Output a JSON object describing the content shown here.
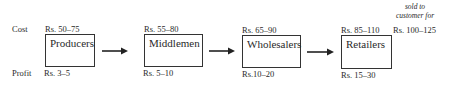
{
  "row_labels": {
    "cost": "Cost",
    "profit": "Profit"
  },
  "stages": [
    {
      "name": "Producers",
      "cost": "Rs. 50–75",
      "profit": "Rs. 3–5"
    },
    {
      "name": "Middlemen",
      "cost": "Rs. 55–80",
      "profit": "Rs. 5–10"
    },
    {
      "name": "Wholesalers",
      "cost": "Rs. 65–90",
      "profit": "Rs.10–20"
    },
    {
      "name": "Retailers",
      "cost": "Rs. 85–110",
      "profit": "Rs. 15–30"
    }
  ],
  "final": {
    "note_line1": "sold to",
    "note_line2": "customer for",
    "price": "Rs. 100–125"
  },
  "colors": {
    "line": "#333333",
    "text": "#2a2a2a",
    "background": "#ffffff"
  }
}
